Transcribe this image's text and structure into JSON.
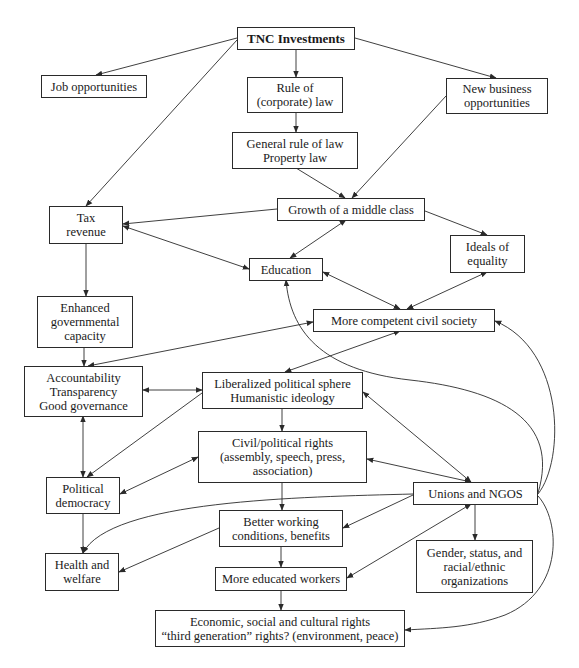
{
  "diagram": {
    "title": "TNC Investments",
    "nodes": {
      "tnc": {
        "lines": [
          "TNC Investments"
        ]
      },
      "jobs": {
        "lines": [
          "Job opportunities"
        ]
      },
      "rule_corp": {
        "lines": [
          "Rule of",
          "(corporate) law"
        ]
      },
      "new_biz": {
        "lines": [
          "New business",
          "opportunities"
        ]
      },
      "general_law": {
        "lines": [
          "General rule of law",
          "Property law"
        ]
      },
      "middle_class": {
        "lines": [
          "Growth of a middle class"
        ]
      },
      "tax": {
        "lines": [
          "Tax",
          "revenue"
        ]
      },
      "education": {
        "lines": [
          "Education"
        ]
      },
      "equality": {
        "lines": [
          "Ideals of",
          "equality"
        ]
      },
      "gov_capacity": {
        "lines": [
          "Enhanced",
          "governmental",
          "capacity"
        ]
      },
      "civil_society": {
        "lines": [
          "More competent civil society"
        ]
      },
      "accountability": {
        "lines": [
          "Accountability",
          "Transparency",
          "Good governance"
        ]
      },
      "liberalized": {
        "lines": [
          "Liberalized political sphere",
          "Humanistic ideology"
        ]
      },
      "civil_rights": {
        "lines": [
          "Civil/political rights",
          "(assembly, speech, press,",
          "association)"
        ]
      },
      "democracy": {
        "lines": [
          "Political",
          "democracy"
        ]
      },
      "unions": {
        "lines": [
          "Unions and NGOS"
        ]
      },
      "working": {
        "lines": [
          "Better working",
          "conditions, benefits"
        ]
      },
      "gender": {
        "lines": [
          "Gender, status, and",
          "racial/ethnic",
          "organizations"
        ]
      },
      "health": {
        "lines": [
          "Health and",
          "welfare"
        ]
      },
      "educated_workers": {
        "lines": [
          "More educated workers"
        ]
      },
      "econ_rights": {
        "lines": [
          "Economic, social and cultural rights",
          "“third generation” rights? (environment, peace)"
        ]
      }
    },
    "edges": [
      {
        "from": "TNC Investments",
        "to": "Job opportunities",
        "type": "directed"
      },
      {
        "from": "TNC Investments",
        "to": "Rule of (corporate) law",
        "type": "directed"
      },
      {
        "from": "TNC Investments",
        "to": "New business opportunities",
        "type": "directed"
      },
      {
        "from": "TNC Investments",
        "to": "Tax revenue",
        "type": "directed"
      },
      {
        "from": "Rule of (corporate) law",
        "to": "General rule of law / Property law",
        "type": "directed"
      },
      {
        "from": "General rule of law / Property law",
        "to": "Growth of a middle class",
        "type": "directed"
      },
      {
        "from": "New business opportunities",
        "to": "Growth of a middle class",
        "type": "directed"
      },
      {
        "from": "Growth of a middle class",
        "to": "Tax revenue",
        "type": "directed"
      },
      {
        "from": "Growth of a middle class",
        "to": "Education",
        "type": "bidirectional"
      },
      {
        "from": "Growth of a middle class",
        "to": "Ideals of equality",
        "type": "directed"
      },
      {
        "from": "Tax revenue",
        "to": "Education",
        "type": "bidirectional"
      },
      {
        "from": "Tax revenue",
        "to": "Enhanced governmental capacity",
        "type": "directed"
      },
      {
        "from": "Education",
        "to": "More competent civil society",
        "type": "bidirectional"
      },
      {
        "from": "Ideals of equality",
        "to": "More competent civil society",
        "type": "bidirectional"
      },
      {
        "from": "Enhanced governmental capacity",
        "to": "Accountability / Transparency / Good governance",
        "type": "directed"
      },
      {
        "from": "More competent civil society",
        "to": "Accountability / Transparency / Good governance",
        "type": "bidirectional"
      },
      {
        "from": "More competent civil society",
        "to": "Liberalized political sphere",
        "type": "bidirectional"
      },
      {
        "from": "Accountability / Transparency / Good governance",
        "to": "Liberalized political sphere",
        "type": "bidirectional"
      },
      {
        "from": "Accountability / Transparency / Good governance",
        "to": "Political democracy",
        "type": "bidirectional"
      },
      {
        "from": "Liberalized political sphere",
        "to": "Political democracy",
        "type": "directed"
      },
      {
        "from": "Liberalized political sphere",
        "to": "Civil/political rights",
        "type": "directed"
      },
      {
        "from": "Liberalized political sphere",
        "to": "Unions and NGOS",
        "type": "bidirectional"
      },
      {
        "from": "Civil/political rights",
        "to": "Political democracy",
        "type": "bidirectional"
      },
      {
        "from": "Civil/political rights",
        "to": "Unions and NGOS",
        "type": "bidirectional"
      },
      {
        "from": "Civil/political rights",
        "to": "Better working conditions, benefits",
        "type": "directed"
      },
      {
        "from": "Political democracy",
        "to": "Health and welfare",
        "type": "directed"
      },
      {
        "from": "Unions and NGOS",
        "to": "Health and welfare",
        "type": "directed"
      },
      {
        "from": "Unions and NGOS",
        "to": "Better working conditions, benefits",
        "type": "directed"
      },
      {
        "from": "Unions and NGOS",
        "to": "More educated workers",
        "type": "bidirectional"
      },
      {
        "from": "Unions and NGOS",
        "to": "Gender, status, and racial/ethnic organizations",
        "type": "directed"
      },
      {
        "from": "Unions and NGOS",
        "to": "More competent civil society",
        "type": "directed"
      },
      {
        "from": "Unions and NGOS",
        "to": "Education",
        "type": "directed"
      },
      {
        "from": "Unions and NGOS",
        "to": "Economic, social and cultural rights",
        "type": "directed"
      },
      {
        "from": "Better working conditions, benefits",
        "to": "Health and welfare",
        "type": "directed"
      },
      {
        "from": "Better working conditions, benefits",
        "to": "More educated workers",
        "type": "directed"
      },
      {
        "from": "More educated workers",
        "to": "Economic, social and cultural rights",
        "type": "directed"
      }
    ],
    "colors": {
      "line": "#2a2a2a",
      "box_border": "#2a2a2a",
      "background": "#ffffff",
      "text": "#1a1a1a"
    }
  }
}
